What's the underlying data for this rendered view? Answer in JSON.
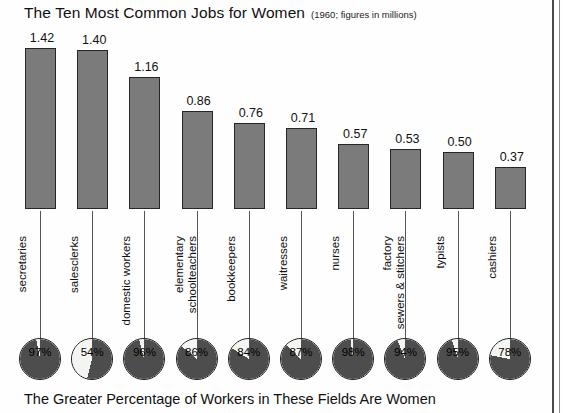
{
  "chart_data": {
    "type": "bar",
    "title": "The Ten Most Common Jobs for Women",
    "subtitle": "(1960; figures in millions)",
    "caption": "The Greater Percentage of Workers in These Fields Are Women",
    "xlabel": "",
    "ylabel": "",
    "ylim": [
      0,
      1.42
    ],
    "grid": false,
    "legend": "none",
    "value_unit": "millions",
    "categories": [
      "secretaries",
      "salesclerks",
      "domestic workers",
      "elementary schoolteachers",
      "bookkeepers",
      "waitresses",
      "nurses",
      "factory sewers & stitchers",
      "typists",
      "cashiers"
    ],
    "category_lines": [
      [
        "secretaries"
      ],
      [
        "salesclerks"
      ],
      [
        "domestic workers"
      ],
      [
        "elementary",
        "schoolteachers"
      ],
      [
        "bookkeepers"
      ],
      [
        "waitresses"
      ],
      [
        "nurses"
      ],
      [
        "factory",
        "sewers & stitchers"
      ],
      [
        "typists"
      ],
      [
        "cashiers"
      ]
    ],
    "values": [
      1.42,
      1.4,
      1.16,
      0.86,
      0.76,
      0.71,
      0.57,
      0.53,
      0.5,
      0.37
    ],
    "value_labels": [
      "1.42",
      "1.40",
      "1.16",
      "0.86",
      "0.76",
      "0.71",
      "0.57",
      "0.53",
      "0.50",
      "0.37"
    ],
    "series": [
      {
        "name": "Women workers (millions)",
        "values": [
          1.42,
          1.4,
          1.16,
          0.86,
          0.76,
          0.71,
          0.57,
          0.53,
          0.5,
          0.37
        ]
      },
      {
        "name": "Percent of workers in field who are women",
        "values": [
          97,
          54,
          96,
          86,
          84,
          87,
          98,
          94,
          95,
          78
        ]
      }
    ],
    "percent_values": [
      97,
      54,
      96,
      86,
      84,
      87,
      98,
      94,
      95,
      78
    ],
    "percent_labels": [
      "97%",
      "54%",
      "96%",
      "86%",
      "84%",
      "87%",
      "98%",
      "94%",
      "95%",
      "78%"
    ]
  },
  "colors": {
    "bar_fill": "#7b7b7b",
    "bar_stroke": "#262626",
    "pie_fill": "#4d4d4d",
    "pie_empty": "#f4f4f2",
    "pie_stroke": "#1d1d1d",
    "text": "#111111",
    "page_rule": "#4a4a4a",
    "background": "#fefefe"
  }
}
